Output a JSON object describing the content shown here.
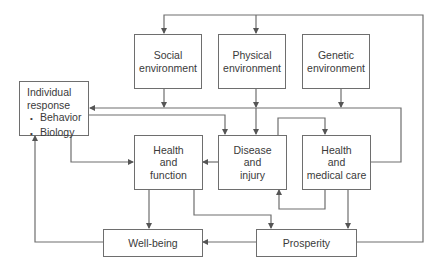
{
  "diagram": {
    "type": "flow-diagram",
    "nodes": {
      "social": {
        "label": "Social\nenvironment"
      },
      "physical": {
        "label": "Physical\nenvironment"
      },
      "genetic": {
        "label": "Genetic\nenvironment"
      },
      "individual": {
        "title": "Individual\nresponse",
        "items": [
          "Behavior",
          "Biology"
        ]
      },
      "health_function": {
        "label": "Health\nand\nfunction"
      },
      "disease": {
        "label": "Disease\nand\ninjury"
      },
      "medical_care": {
        "label": "Health\nand\nmedical care"
      },
      "wellbeing": {
        "label": "Well-being"
      },
      "prosperity": {
        "label": "Prosperity"
      }
    },
    "edges": [
      {
        "from": "Prosperity",
        "to": "Social environment"
      },
      {
        "from": "Prosperity",
        "to": "Physical environment"
      },
      {
        "from": "Social environment",
        "to": "Individual response"
      },
      {
        "from": "Social environment",
        "to": "Disease and injury"
      },
      {
        "from": "Social environment",
        "to": "Health and medical care"
      },
      {
        "from": "Physical environment",
        "to": "Individual response"
      },
      {
        "from": "Physical environment",
        "to": "Disease and injury"
      },
      {
        "from": "Physical environment",
        "to": "Health and medical care"
      },
      {
        "from": "Genetic environment",
        "to": "Individual response"
      },
      {
        "from": "Genetic environment",
        "to": "Disease and injury"
      },
      {
        "from": "Genetic environment",
        "to": "Health and medical care"
      },
      {
        "from": "Health and medical care",
        "to": "Individual response"
      },
      {
        "from": "Individual response",
        "to": "Health and function"
      },
      {
        "from": "Disease and injury",
        "to": "Health and function"
      },
      {
        "from": "Health and medical care",
        "to": "Disease and injury"
      },
      {
        "from": "Health and function",
        "to": "Well-being"
      },
      {
        "from": "Health and function",
        "to": "Prosperity"
      },
      {
        "from": "Health and medical care",
        "to": "Prosperity"
      },
      {
        "from": "Prosperity",
        "to": "Well-being"
      },
      {
        "from": "Well-being",
        "to": "Individual response"
      }
    ],
    "colors": {
      "line": "#6e6e6e",
      "text": "#3a3a3a",
      "background": "#ffffff"
    }
  }
}
